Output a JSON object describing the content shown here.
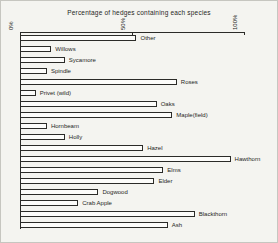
{
  "title": "Percentage of hedges containing each species",
  "colors": {
    "background": "#f4f4f0",
    "frame": "#c6c6c0",
    "line": "#2b2b28",
    "bar_fill": "#fcfcfa",
    "text": "#1f1f1c"
  },
  "chart_data": {
    "type": "bar",
    "orientation": "horizontal",
    "title": "Percentage of hedges containing each species",
    "categories": [
      "Other",
      "Willows",
      "Sycamore",
      "Spindle",
      "Roses",
      "Privet (wild)",
      "Oaks",
      "Maple(field)",
      "Hornbeam",
      "Holly",
      "Hazel",
      "Hawthorn",
      "Elms",
      "Elder",
      "Dogwood",
      "Crab Apple",
      "Blackthorn",
      "Ash"
    ],
    "values": [
      52,
      14,
      20,
      12,
      70,
      7,
      61,
      68,
      12,
      20,
      55,
      94,
      64,
      60,
      35,
      26,
      78,
      66
    ],
    "xlim": [
      0,
      100
    ],
    "x_ticks": [
      {
        "value": 0,
        "label": "0%"
      },
      {
        "value": 50,
        "label": "50%"
      },
      {
        "value": 100,
        "label": "100%"
      }
    ],
    "tick_label_rotation": "vertical",
    "axis_position": "top",
    "grid": false,
    "legend": false,
    "value_labels_shown": false,
    "category_labels_position": "right-of-bar"
  }
}
